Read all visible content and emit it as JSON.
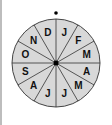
{
  "diagram": {
    "title": "",
    "type": "month-wheel",
    "center": {
      "x": 56,
      "y": 63
    },
    "radius": 44,
    "segments": 12,
    "labels": [
      "J",
      "F",
      "M",
      "A",
      "M",
      "J",
      "J",
      "A",
      "S",
      "O",
      "N",
      "D"
    ],
    "marker": "top-dot",
    "colors": {
      "fill": "#d8d8d8",
      "stroke": "#333333",
      "text": "#111111"
    }
  }
}
